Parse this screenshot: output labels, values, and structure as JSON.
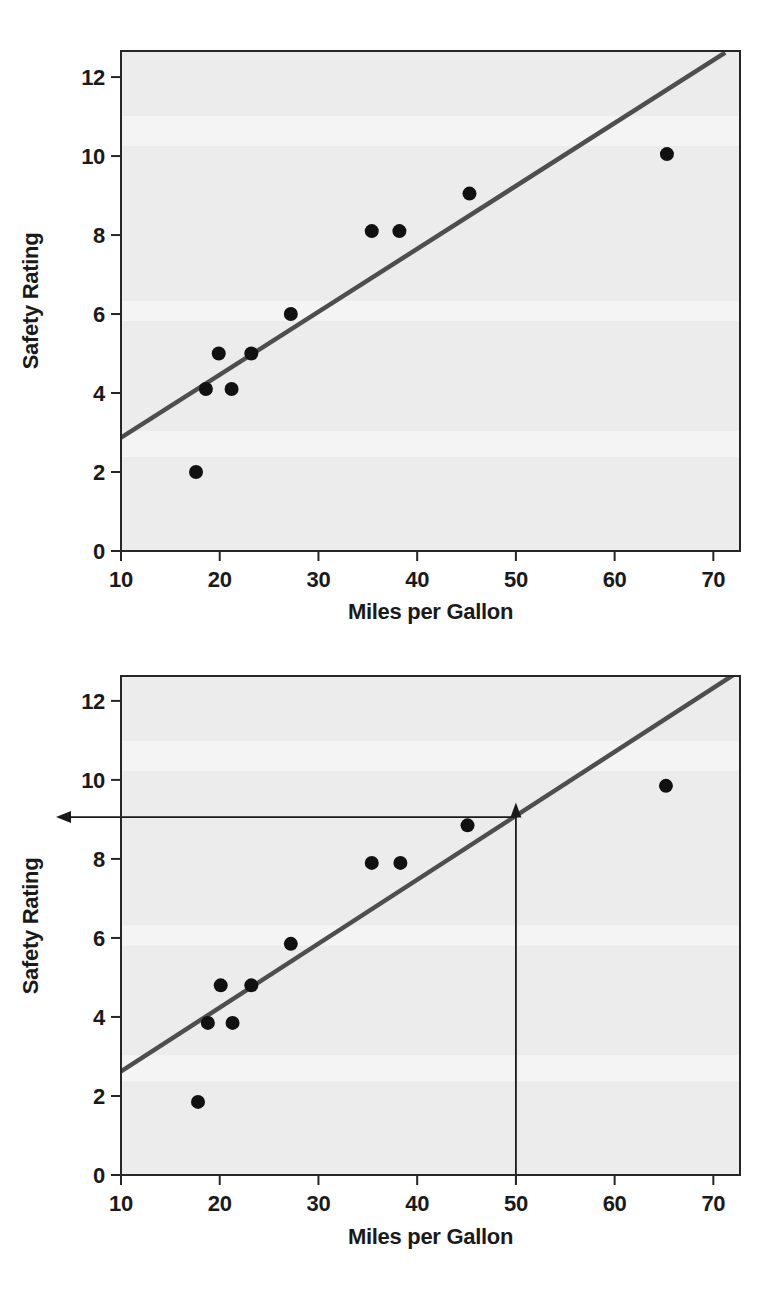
{
  "figure": {
    "background": "#ffffff",
    "text_color": "#1a1a1a"
  },
  "chart_data": [
    {
      "type": "scatter",
      "title": "",
      "xlabel": "Miles per Gallon",
      "ylabel": "Safety Rating",
      "xlim": [
        10,
        72.7
      ],
      "ylim": [
        0,
        12.66
      ],
      "x_ticks": [
        10,
        20,
        30,
        40,
        50,
        60,
        70
      ],
      "y_ticks": [
        0,
        2,
        4,
        6,
        8,
        10,
        12
      ],
      "grid": false,
      "legend": null,
      "points": [
        [
          17.6,
          2.0
        ],
        [
          18.6,
          4.1
        ],
        [
          21.2,
          4.1
        ],
        [
          19.9,
          5.0
        ],
        [
          23.2,
          5.0
        ],
        [
          27.2,
          6.0
        ],
        [
          35.4,
          8.1
        ],
        [
          38.2,
          8.1
        ],
        [
          45.3,
          9.05
        ],
        [
          65.3,
          10.05
        ]
      ],
      "regression_line": {
        "x1": 10,
        "y1": 2.87,
        "x2": 71.2,
        "y2": 12.62
      },
      "colors": {
        "plot_bg": "#ececec",
        "point": "#111111",
        "line": "#4e4e4e",
        "axis": "#262626"
      }
    },
    {
      "type": "scatter",
      "title": "",
      "xlabel": "Miles per Gallon",
      "ylabel": "Safety Rating",
      "xlim": [
        10,
        72.7
      ],
      "ylim": [
        0,
        12.63
      ],
      "x_ticks": [
        10,
        20,
        30,
        40,
        50,
        60,
        70
      ],
      "y_ticks": [
        0,
        2,
        4,
        6,
        8,
        10,
        12
      ],
      "grid": false,
      "legend": null,
      "points": [
        [
          17.8,
          1.85
        ],
        [
          18.8,
          3.85
        ],
        [
          21.3,
          3.85
        ],
        [
          20.1,
          4.8
        ],
        [
          23.2,
          4.8
        ],
        [
          27.2,
          5.85
        ],
        [
          35.4,
          7.9
        ],
        [
          38.3,
          7.9
        ],
        [
          45.1,
          8.85
        ],
        [
          65.2,
          9.85
        ]
      ],
      "regression_line": {
        "x1": 10,
        "y1": 2.62,
        "x2": 72.3,
        "y2": 12.7
      },
      "annotation": {
        "predict_x": 50,
        "predicted_y": 9.1,
        "vline_top_y": 9.43,
        "hline_y": 9.06,
        "color": "#1a1a1a"
      },
      "colors": {
        "plot_bg": "#ececec",
        "point": "#111111",
        "line": "#4e4e4e",
        "axis": "#262626"
      }
    }
  ]
}
